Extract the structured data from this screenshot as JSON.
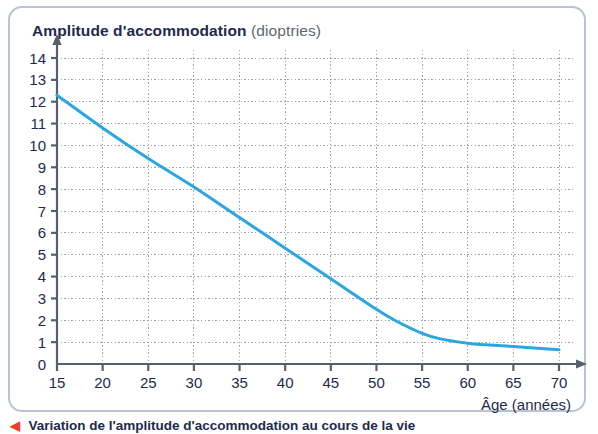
{
  "figure": {
    "title_main": "Amplitude d'accommodation",
    "title_unit": "(dioptries)",
    "caption_bullet": "◀",
    "caption_text": "Variation de l'amplitude d'accommodation au cours de la vie",
    "border_color": "#b9c4d2",
    "background": "#ffffff"
  },
  "chart_data": {
    "type": "line",
    "title": "Amplitude d'accommodation (dioptries)",
    "xlabel": "Âge (années)",
    "ylabel": "Amplitude d'accommodation (dioptries)",
    "yunit": "dioptries",
    "xunit": "années",
    "xlim": [
      15,
      70
    ],
    "ylim": [
      0,
      14
    ],
    "xticks": [
      15,
      20,
      25,
      30,
      35,
      40,
      45,
      50,
      55,
      60,
      65,
      70
    ],
    "xtick_labels": [
      "15",
      "20",
      "25",
      "30",
      "35",
      "40",
      "45",
      "50",
      "55",
      "60",
      "65",
      "70"
    ],
    "yticks": [
      0,
      1,
      2,
      3,
      4,
      5,
      6,
      7,
      8,
      9,
      10,
      11,
      12,
      13,
      14
    ],
    "ytick_labels": [
      "0",
      "1",
      "2",
      "3",
      "4",
      "5",
      "6",
      "7",
      "8",
      "9",
      "10",
      "11",
      "12",
      "13",
      "14"
    ],
    "grid": true,
    "grid_style": "dotted",
    "grid_color": "#9aa3ad",
    "legend": false,
    "line_color": "#2ba6e0",
    "line_width": 3,
    "series": [
      {
        "name": "Amplitude d'accommodation",
        "x": [
          15,
          20,
          25,
          30,
          35,
          40,
          45,
          50,
          52,
          55,
          57,
          60,
          62,
          65,
          70
        ],
        "values": [
          12.3,
          10.8,
          9.4,
          8.1,
          6.7,
          5.3,
          3.9,
          2.5,
          2.0,
          1.4,
          1.15,
          0.95,
          0.88,
          0.8,
          0.65
        ]
      }
    ]
  },
  "axes": {
    "x_axis_name": "Âge (années)",
    "y_axis_arrow": true,
    "x_axis_arrow": true,
    "axis_color": "#55606b"
  }
}
